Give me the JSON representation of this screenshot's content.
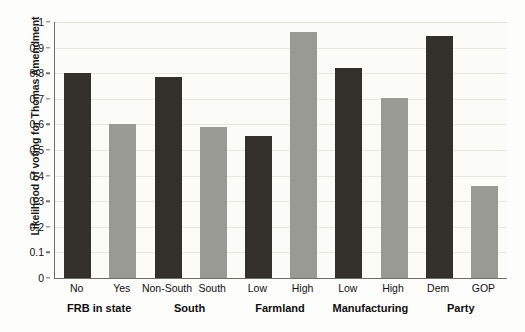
{
  "chart_data": {
    "type": "bar",
    "title": "",
    "subtitle": "",
    "xlabel": "",
    "ylabel": "Likelihood of voting for Thomas Amendment",
    "ylim": [
      0,
      1
    ],
    "yticks": [
      "0",
      "0.1",
      "0.2",
      "0.3",
      "0.4",
      "0.5",
      "0.6",
      "0.7",
      "0.8",
      "0.9",
      "1"
    ],
    "ytick_values": [
      0,
      0.1,
      0.2,
      0.3,
      0.4,
      0.5,
      0.6,
      0.7,
      0.8,
      0.9,
      1
    ],
    "grid": true,
    "legend": "none",
    "categories": [
      "No",
      "Yes",
      "Non-South",
      "South",
      "Low",
      "High",
      "Low",
      "High",
      "Dem",
      "GOP"
    ],
    "values": [
      0.8,
      0.6,
      0.785,
      0.59,
      0.555,
      0.96,
      0.82,
      0.705,
      0.945,
      0.36
    ],
    "bar_colors": [
      "dark",
      "light",
      "dark",
      "light",
      "dark",
      "light",
      "dark",
      "light",
      "dark",
      "light"
    ],
    "groups": [
      {
        "label": "FRB in state",
        "categories": [
          "No",
          "Yes"
        ],
        "values": [
          0.8,
          0.6
        ]
      },
      {
        "label": "South",
        "categories": [
          "Non-South",
          "South"
        ],
        "values": [
          0.785,
          0.59
        ]
      },
      {
        "label": "Farmland",
        "categories": [
          "Low",
          "High"
        ],
        "values": [
          0.555,
          0.96
        ]
      },
      {
        "label": "Manufacturing",
        "categories": [
          "Low",
          "High"
        ],
        "values": [
          0.82,
          0.705
        ]
      },
      {
        "label": "Party",
        "categories": [
          "Dem",
          "GOP"
        ],
        "values": [
          0.945,
          0.36
        ]
      }
    ]
  },
  "colors": {
    "dark_bar": "#332f2a",
    "light_bar": "#9a9a95",
    "background": "#fdfdfb",
    "plot_background": "#fbfbf7",
    "gridline": "#e7e7e0",
    "axis": "#6f6f68",
    "text": "#111111"
  }
}
